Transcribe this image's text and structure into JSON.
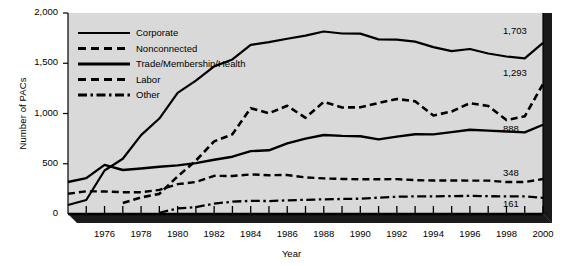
{
  "chart_data": {
    "type": "line",
    "title": "",
    "xlabel": "Year",
    "ylabel": "Number of PACs",
    "xlim": [
      1974,
      2000
    ],
    "ylim": [
      0,
      2000
    ],
    "grid": false,
    "legend_position": "upper-left-inside",
    "x": [
      1974,
      1975,
      1976,
      1977,
      1978,
      1979,
      1980,
      1981,
      1982,
      1983,
      1984,
      1985,
      1986,
      1987,
      1988,
      1989,
      1990,
      1991,
      1992,
      1993,
      1994,
      1995,
      1996,
      1997,
      1998,
      1999,
      2000
    ],
    "ytick_labels": [
      "0",
      "500",
      "1,000",
      "1,500",
      "2,000"
    ],
    "ytick_values": [
      0,
      500,
      1000,
      1500,
      2000
    ],
    "xtick_labels": [
      "1976",
      "1978",
      "1980",
      "1982",
      "1984",
      "1986",
      "1988",
      "1990",
      "1992",
      "1994",
      "1996",
      "1998",
      "2000"
    ],
    "xtick_values": [
      1976,
      1978,
      1980,
      1982,
      1984,
      1986,
      1988,
      1990,
      1992,
      1994,
      1996,
      1998,
      2000
    ],
    "series": [
      {
        "name": "Corporate",
        "style": "solid",
        "end_label": "1,703",
        "values": [
          89,
          139,
          433,
          550,
          785,
          950,
          1206,
          1327,
          1469,
          1538,
          1682,
          1710,
          1744,
          1775,
          1816,
          1796,
          1795,
          1738,
          1735,
          1715,
          1660,
          1620,
          1642,
          1597,
          1567,
          1548,
          1703
        ]
      },
      {
        "name": "Nonconnected",
        "style": "dashed",
        "end_label": "1,293",
        "values": [
          0,
          0,
          0,
          110,
          165,
          200,
          374,
          531,
          723,
          793,
          1053,
          1003,
          1077,
          957,
          1115,
          1060,
          1062,
          1105,
          1145,
          1121,
          980,
          1020,
          1103,
          1075,
          935,
          972,
          1293
        ]
      },
      {
        "name": "Trade/Membership/Health",
        "style": "solid",
        "end_label": "888",
        "values": [
          318,
          357,
          489,
          438,
          453,
          470,
          484,
          506,
          540,
          570,
          626,
          634,
          703,
          750,
          786,
          777,
          774,
          742,
          770,
          793,
          792,
          815,
          838,
          830,
          821,
          812,
          888
        ]
      },
      {
        "name": "Labor",
        "style": "dashed",
        "end_label": "348",
        "values": [
          201,
          226,
          224,
          217,
          217,
          240,
          297,
          318,
          380,
          378,
          394,
          386,
          388,
          364,
          354,
          349,
          346,
          346,
          347,
          337,
          333,
          334,
          332,
          332,
          318,
          318,
          348
        ]
      },
      {
        "name": "Other",
        "style": "dashdot",
        "end_label": "161",
        "values": [
          0,
          0,
          0,
          0,
          0,
          12,
          56,
          68,
          103,
          123,
          131,
          129,
          136,
          141,
          146,
          150,
          152,
          163,
          172,
          175,
          176,
          178,
          180,
          177,
          175,
          176,
          161
        ]
      }
    ]
  },
  "colors": {
    "plot_background": "#d9d9d9",
    "line": "#000000",
    "shadow": "#1a1a1a",
    "page_background": "#ffffff",
    "text": "#000000"
  }
}
